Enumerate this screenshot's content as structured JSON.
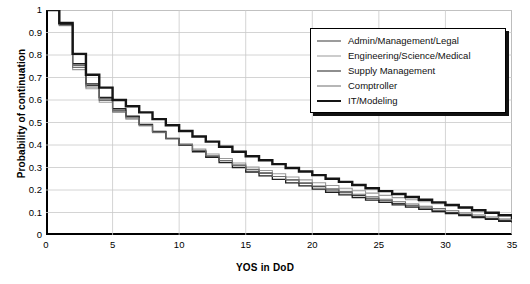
{
  "chart_data": {
    "type": "line",
    "title": "",
    "xlabel": "YOS in DoD",
    "ylabel": "Probability of continuation",
    "xlim": [
      0,
      35
    ],
    "ylim": [
      0,
      1
    ],
    "grid": true,
    "legend_position": "top-right",
    "step": "post",
    "xticks": [
      "0",
      "5",
      "10",
      "15",
      "20",
      "25",
      "30",
      "35"
    ],
    "yticks": [
      "0",
      "0.1",
      "0.2",
      "0.3",
      "0.4",
      "0.5",
      "0.6",
      "0.7",
      "0.8",
      "0.9",
      "1"
    ],
    "x": [
      0,
      1,
      2,
      3,
      4,
      5,
      6,
      7,
      8,
      9,
      10,
      11,
      12,
      13,
      14,
      15,
      16,
      17,
      18,
      19,
      20,
      21,
      22,
      23,
      24,
      25,
      26,
      27,
      28,
      29,
      30,
      31,
      32,
      33,
      34,
      35
    ],
    "series": [
      {
        "name": "Admin/Management/Legal",
        "color": "#3a3a3a",
        "width": 1.1,
        "values": [
          1.0,
          0.935,
          0.755,
          0.665,
          0.605,
          0.555,
          0.525,
          0.49,
          0.46,
          0.43,
          0.4,
          0.375,
          0.35,
          0.33,
          0.31,
          0.29,
          0.275,
          0.26,
          0.245,
          0.23,
          0.215,
          0.2,
          0.188,
          0.175,
          0.163,
          0.152,
          0.14,
          0.13,
          0.12,
          0.11,
          0.1,
          0.091,
          0.082,
          0.073,
          0.065,
          0.058
        ]
      },
      {
        "name": "Engineering/Science/Medical",
        "color": "#9a9a9a",
        "width": 1.1,
        "values": [
          1.0,
          0.93,
          0.735,
          0.65,
          0.59,
          0.545,
          0.515,
          0.485,
          0.455,
          0.43,
          0.405,
          0.382,
          0.36,
          0.34,
          0.32,
          0.302,
          0.287,
          0.272,
          0.258,
          0.245,
          0.232,
          0.22,
          0.208,
          0.197,
          0.186,
          0.176,
          0.166,
          0.157,
          0.148,
          0.139,
          0.13,
          0.12,
          0.11,
          0.1,
          0.09,
          0.078
        ]
      },
      {
        "name": "Supply Management",
        "color": "#1f1f1f",
        "width": 1.3,
        "values": [
          1.0,
          0.938,
          0.762,
          0.672,
          0.612,
          0.562,
          0.528,
          0.492,
          0.46,
          0.428,
          0.398,
          0.37,
          0.345,
          0.322,
          0.3,
          0.28,
          0.263,
          0.247,
          0.232,
          0.218,
          0.204,
          0.19,
          0.178,
          0.166,
          0.155,
          0.145,
          0.134,
          0.124,
          0.114,
          0.104,
          0.095,
          0.086,
          0.077,
          0.069,
          0.061,
          0.054
        ]
      },
      {
        "name": "Comptroller",
        "color": "#6e6e6e",
        "width": 1.1,
        "values": [
          1.0,
          0.932,
          0.745,
          0.658,
          0.598,
          0.55,
          0.52,
          0.488,
          0.457,
          0.428,
          0.4,
          0.376,
          0.352,
          0.331,
          0.311,
          0.292,
          0.276,
          0.26,
          0.246,
          0.232,
          0.218,
          0.205,
          0.193,
          0.181,
          0.17,
          0.159,
          0.148,
          0.138,
          0.128,
          0.118,
          0.108,
          0.098,
          0.089,
          0.08,
          0.071,
          0.062
        ]
      },
      {
        "name": "IT/Modeling",
        "color": "#151515",
        "width": 2.4,
        "values": [
          1.0,
          0.942,
          0.805,
          0.712,
          0.655,
          0.6,
          0.572,
          0.545,
          0.515,
          0.488,
          0.462,
          0.438,
          0.415,
          0.392,
          0.37,
          0.35,
          0.332,
          0.315,
          0.298,
          0.282,
          0.266,
          0.25,
          0.236,
          0.222,
          0.208,
          0.195,
          0.182,
          0.169,
          0.157,
          0.145,
          0.133,
          0.122,
          0.11,
          0.099,
          0.088,
          0.07
        ]
      }
    ]
  }
}
